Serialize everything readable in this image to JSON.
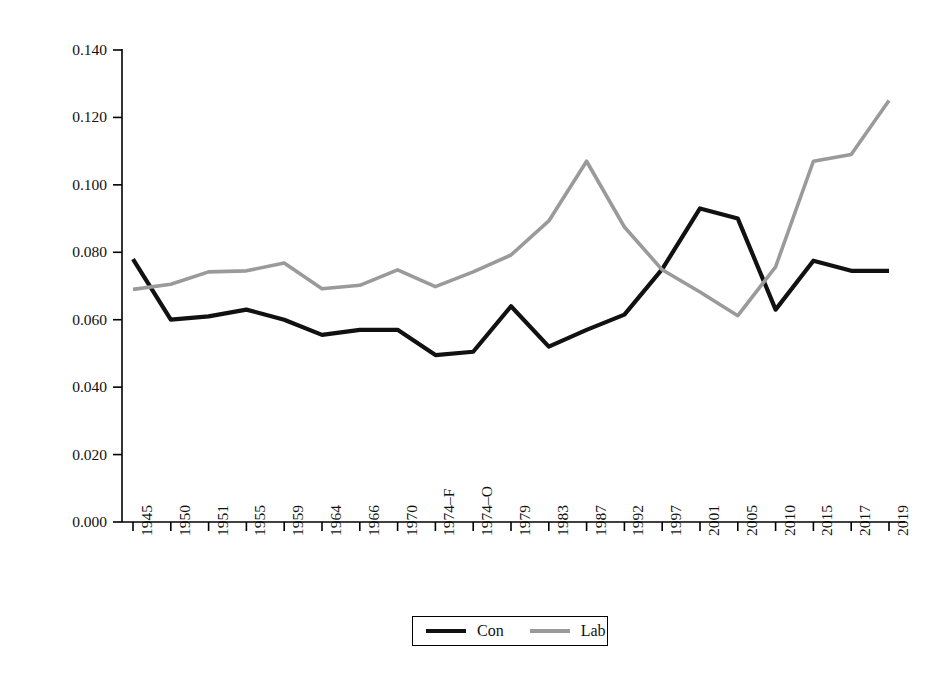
{
  "chart_data": {
    "type": "line",
    "title": "",
    "xlabel": "",
    "ylabel": "Increase in majority per seat won (vote share)",
    "categories": [
      "1945",
      "1950",
      "1951",
      "1955",
      "1959",
      "1964",
      "1966",
      "1970",
      "1974–F",
      "1974–O",
      "1979",
      "1983",
      "1987",
      "1992",
      "1997",
      "2001",
      "2005",
      "2010",
      "2015",
      "2017",
      "2019"
    ],
    "ylim": [
      0.0,
      0.14
    ],
    "yticks": [
      "0.000",
      "0.020",
      "0.040",
      "0.060",
      "0.080",
      "0.100",
      "0.120",
      "0.140"
    ],
    "ytick_values": [
      0.0,
      0.02,
      0.04,
      0.06,
      0.08,
      0.1,
      0.12,
      0.14
    ],
    "grid": false,
    "legend_position": "bottom-center",
    "series": [
      {
        "name": "Con",
        "color": "#111111",
        "values": [
          0.078,
          0.06,
          0.061,
          0.063,
          0.06,
          0.0555,
          0.057,
          0.057,
          0.0495,
          0.0505,
          0.064,
          0.052,
          0.057,
          0.0615,
          0.075,
          0.093,
          0.09,
          0.063,
          0.0775,
          0.0745,
          0.0745
        ]
      },
      {
        "name": "Lab",
        "color": "#9a9a9a",
        "values": [
          0.069,
          0.0705,
          0.0742,
          0.0745,
          0.0768,
          0.0692,
          0.0702,
          0.0748,
          0.0698,
          0.0742,
          0.0792,
          0.0893,
          0.107,
          0.0875,
          0.0748,
          0.0682,
          0.0612,
          0.0757,
          0.107,
          0.109,
          0.125
        ]
      }
    ]
  },
  "legend": {
    "entries": [
      {
        "label": "Con",
        "color": "#111111"
      },
      {
        "label": "Lab",
        "color": "#9a9a9a"
      }
    ]
  },
  "axes": {
    "y_axis_label": "Increase in majority per seat won (vote share)"
  }
}
